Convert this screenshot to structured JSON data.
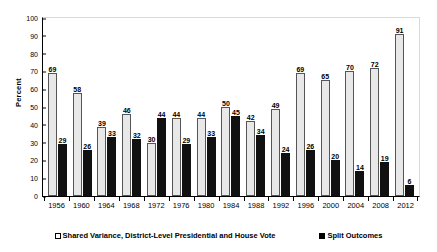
{
  "chart_data": {
    "type": "bar",
    "title": "",
    "xlabel": "",
    "ylabel": "Percent",
    "ylim": [
      0,
      100
    ],
    "ytick_step": 10,
    "yticks": [
      100,
      90,
      80,
      70,
      60,
      50,
      40,
      30,
      20,
      10,
      0
    ],
    "grid": false,
    "legend_position": "bottom",
    "categories": [
      "1956",
      "1960",
      "1964",
      "1968",
      "1972",
      "1976",
      "1980",
      "1984",
      "1988",
      "1992",
      "1996",
      "2000",
      "2004",
      "2008",
      "2012"
    ],
    "series": [
      {
        "name": "Shared Variance, District-Level Presidential and House Vote",
        "style": "light",
        "color": "#e8e8e8",
        "values": [
          69,
          58,
          39,
          46,
          30,
          44,
          44,
          50,
          42,
          49,
          69,
          65,
          70,
          72,
          91
        ]
      },
      {
        "name": "Split Outcomes",
        "style": "dark",
        "color": "#111111",
        "values": [
          29,
          26,
          33,
          32,
          44,
          29,
          33,
          45,
          34,
          24,
          26,
          20,
          14,
          19,
          6
        ]
      }
    ]
  },
  "legend": {
    "items": [
      {
        "label": "Shared Variance, District-Level Presidential and House Vote",
        "swatch": "open-square-marker"
      },
      {
        "label": "Split Outcomes",
        "swatch": "filled-square-marker"
      }
    ]
  }
}
